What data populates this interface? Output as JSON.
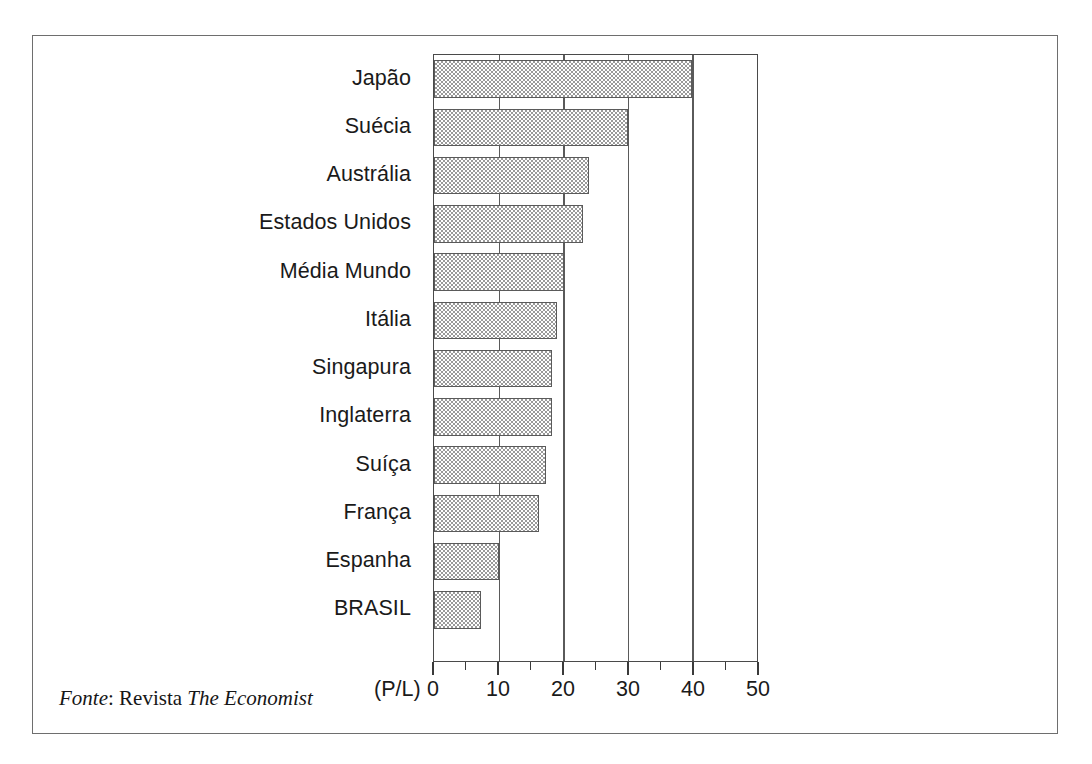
{
  "chart_data": {
    "type": "bar",
    "orientation": "horizontal",
    "title": "",
    "subtitle": "",
    "xlabel": "(P/L)",
    "ylabel": "",
    "xlim": [
      0,
      50
    ],
    "ylim": null,
    "grid": true,
    "legend": null,
    "categories": [
      "Japão",
      "Suécia",
      "Austrália",
      "Estados  Unidos",
      "Média  Mundo",
      "Itália",
      "Singapura",
      "Inglaterra",
      "Suíça",
      "França",
      "Espanha",
      "BRASIL"
    ],
    "values": [
      40,
      30,
      24,
      23,
      20.2,
      19,
      18.3,
      18.3,
      17.3,
      16.3,
      10,
      7.2
    ],
    "xticks": [
      0,
      10,
      20,
      30,
      40,
      50
    ],
    "xticklabels": [
      "0",
      "10",
      "20",
      "30",
      "40",
      "50"
    ],
    "xminorticks": [
      5,
      15,
      25,
      35,
      45
    ],
    "unit_label": "(P/L)",
    "bar_fill": "#9a9a9a",
    "bar_edge": "#5a5a5a",
    "axis_color": "#4a4a4a"
  },
  "source": {
    "prefix": "Fonte",
    "separator": ": ",
    "publication_word": "Revista ",
    "publication": "The Economist"
  }
}
